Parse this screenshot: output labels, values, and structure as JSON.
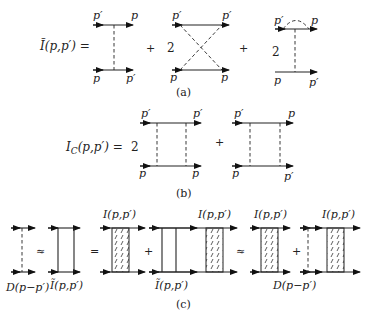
{
  "panels": [
    {
      "id": "a",
      "caption": "(a)",
      "lhs": "Ĩ(p,p′) =",
      "terms": [
        {
          "coef": "",
          "type": "single-exchange",
          "labels": {
            "top_left": "p′",
            "top_right": "p",
            "bottom_left": "p",
            "bottom_right": "p′"
          }
        },
        {
          "op": "+",
          "coef": "2",
          "type": "crossed-exchange",
          "labels": {
            "top_left": "p′",
            "top_right": "p′",
            "bottom_left": "p",
            "bottom_right": "p"
          }
        },
        {
          "op": "+",
          "coef": "2",
          "type": "exchange-with-self-energy-arc",
          "labels": {
            "top_left": "p′",
            "top_right": "p",
            "bottom_left": "p",
            "bottom_right": "p′"
          }
        }
      ]
    },
    {
      "id": "b",
      "caption": "(b)",
      "lhs": "I",
      "lhs_sub": "C",
      "lhs_rest": "(p,p′)  =",
      "terms": [
        {
          "coef": "2",
          "type": "ladder-two-exchange",
          "labels": {
            "top_left": "p′",
            "top_right": "p′",
            "bottom_left": "p",
            "bottom_right": "p"
          }
        },
        {
          "op": "+",
          "coef": "",
          "type": "ladder-two-exchange",
          "labels": {
            "top_left": "p′",
            "top_right": "p",
            "bottom_left": "p",
            "bottom_right": "p′"
          }
        }
      ]
    },
    {
      "id": "c",
      "caption": "(c)",
      "operators": [
        "≈",
        "=",
        "+",
        "≈",
        "+"
      ],
      "labels": {
        "D": "D(p−p′)",
        "I_tilde": "Ĩ(p,p′)",
        "I": "I(p,p′)"
      }
    }
  ]
}
